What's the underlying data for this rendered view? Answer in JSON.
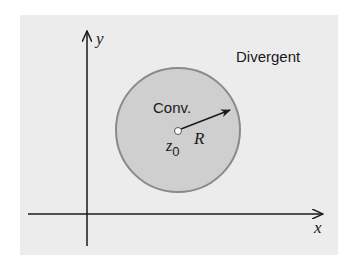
{
  "diagram": {
    "region_outer_label": "Divergent",
    "region_inner_label": "Conv.",
    "center_label": "z",
    "center_subscript": "0",
    "radius_label": "R",
    "x_axis_label": "x",
    "y_axis_label": "y",
    "colors": {
      "panel_bg": "#ececec",
      "disk_fill": "#cfcfcf",
      "disk_stroke": "#8a8a8a",
      "ink": "#1a1a1a"
    }
  }
}
